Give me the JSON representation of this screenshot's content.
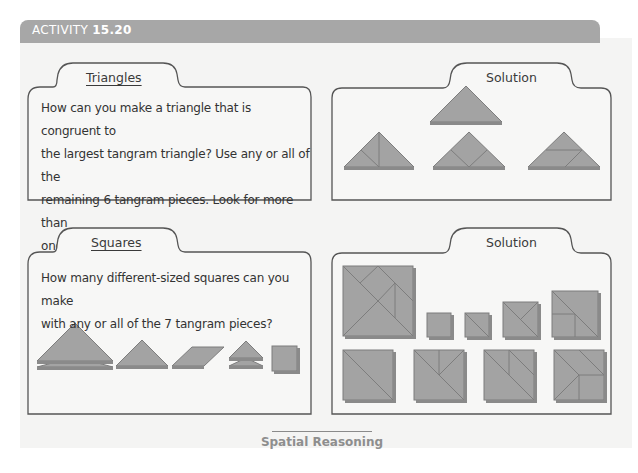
{
  "header": {
    "prefix": "ACTIVITY",
    "number": "15.20",
    "bar_color": "#a7a7a7"
  },
  "cards": [
    {
      "id": "triangles-problem",
      "tab_label": "Triangles",
      "prompt_lines": [
        "How can you make a triangle that is congruent to",
        "the largest tangram triangle? Use any or all of the",
        "remaining 6 tangram pieces. Look for more than",
        "one way."
      ]
    },
    {
      "id": "triangles-solution",
      "tab_label": "Solution",
      "figures": [
        "large-triangle",
        "triangle-from-2-small-1-medium-split",
        "triangle-from-square-and-2-small",
        "triangle-from-parallelogram-and-2-small"
      ]
    },
    {
      "id": "squares-problem",
      "tab_label": "Squares",
      "prompt_lines": [
        "How many different-sized squares can you make",
        "with any or all of the 7 tangram pieces?"
      ],
      "pieces": [
        "2 large triangles",
        "medium triangle",
        "parallelogram",
        "2 small triangles",
        "square"
      ]
    },
    {
      "id": "squares-solution",
      "tab_label": "Solution",
      "figures_row1": [
        "7-piece-square",
        "1-piece-square",
        "2-piece-square",
        "4-piece-square",
        "5-piece-square"
      ],
      "figures_row2": [
        "2-large-triangle-square",
        "square-variant-a",
        "square-variant-b",
        "square-variant-c"
      ]
    }
  ],
  "piece_color": "#a3a3a3",
  "piece_edge": "#7d7d7d",
  "footer": {
    "label": "Spatial Reasoning"
  }
}
